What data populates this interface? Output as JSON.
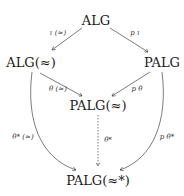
{
  "diagram": {
    "nodes": {
      "alg": "ALG",
      "alg_approx": "ALG(≈)",
      "palg": "PALG",
      "palg_approx": "PALG(≈)",
      "palg_approx_star": "PALG(≈*)"
    },
    "arrows": {
      "iota_approx": "ι (≈)",
      "p_iota": "p ι",
      "theta_approx": "θ (≈)",
      "p_theta": "p θ",
      "theta_star_approx": "θ* (≈)",
      "theta_star": "θ*",
      "p_theta_star": "p θ*"
    }
  }
}
